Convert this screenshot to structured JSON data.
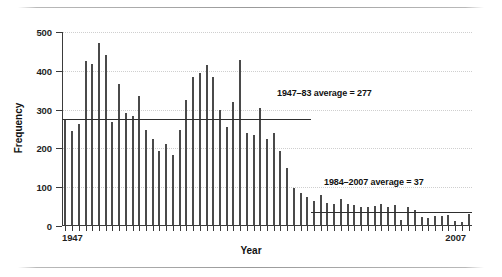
{
  "figure": {
    "background": "#ffffff",
    "bar_color": "#4a4a4a",
    "line_color": "#2e2e2e",
    "grid_color": "#cfcfcf"
  },
  "axis": {
    "x_label": "Year",
    "y_label": "Frequency",
    "x_start_label": "1947",
    "x_end_label": "2007",
    "y_ticks": [
      0,
      100,
      200,
      300,
      400,
      500
    ]
  },
  "annotations": [
    {
      "name": "avg-1947-83",
      "text": "1947–83 average = 277",
      "value": 277
    },
    {
      "name": "avg-1984-2007",
      "text": "1984–2007 average = 37",
      "value": 37
    }
  ],
  "chart_data": {
    "type": "bar",
    "title": "",
    "xlabel": "Year",
    "ylabel": "Frequency",
    "ylim": [
      0,
      500
    ],
    "yticks": [
      0,
      100,
      200,
      300,
      400,
      500
    ],
    "grid": true,
    "legend": "none",
    "categories": [
      "1947",
      "1948",
      "1949",
      "1950",
      "1951",
      "1952",
      "1953",
      "1954",
      "1955",
      "1956",
      "1957",
      "1958",
      "1959",
      "1960",
      "1961",
      "1962",
      "1963",
      "1964",
      "1965",
      "1966",
      "1967",
      "1968",
      "1969",
      "1970",
      "1971",
      "1972",
      "1973",
      "1974",
      "1975",
      "1976",
      "1977",
      "1978",
      "1979",
      "1980",
      "1981",
      "1982",
      "1983",
      "1984",
      "1985",
      "1986",
      "1987",
      "1988",
      "1989",
      "1990",
      "1991",
      "1992",
      "1993",
      "1994",
      "1995",
      "1996",
      "1997",
      "1998",
      "1999",
      "2000",
      "2001",
      "2002",
      "2003",
      "2004",
      "2005",
      "2006",
      "2007"
    ],
    "values": [
      273,
      246,
      264,
      426,
      418,
      471,
      441,
      267,
      366,
      290,
      283,
      335,
      248,
      224,
      194,
      212,
      183,
      248,
      326,
      385,
      395,
      414,
      385,
      300,
      255,
      320,
      428,
      240,
      235,
      303,
      223,
      241,
      193,
      150,
      99,
      86,
      76,
      64,
      80,
      60,
      57,
      70,
      58,
      54,
      48,
      50,
      52,
      57,
      48,
      53,
      16,
      49,
      40,
      22,
      20,
      25,
      26,
      29,
      14,
      11,
      30
    ],
    "reference_lines": [
      {
        "label": "1947–83 average = 277",
        "value": 277,
        "x_from": "1947",
        "x_to": "1983"
      },
      {
        "label": "1984–2007 average = 37",
        "value": 37,
        "x_from": "1984",
        "x_to": "2007"
      }
    ]
  }
}
